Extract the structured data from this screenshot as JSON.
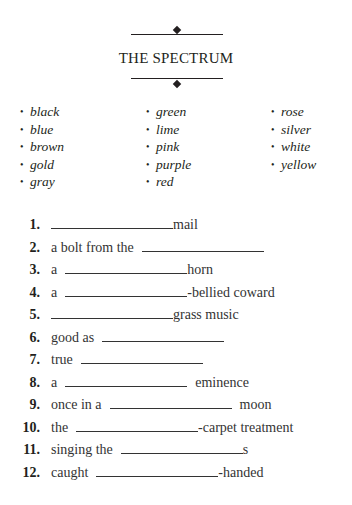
{
  "header": {
    "title": "THE SPECTRUM",
    "ornament_icon": "diamond-icon"
  },
  "word_bank": {
    "columns": [
      [
        "black",
        "blue",
        "brown",
        "gold",
        "gray"
      ],
      [
        "green",
        "lime",
        "pink",
        "purple",
        "red"
      ],
      [
        "rose",
        "silver",
        "white",
        "yellow"
      ]
    ],
    "bullet": "•"
  },
  "items": [
    {
      "num": "1.",
      "before": "",
      "after": "mail",
      "blank_width": 122,
      "gap_before": 0,
      "gap_after": 0
    },
    {
      "num": "2.",
      "before": "a bolt from the",
      "after": "",
      "blank_width": 122,
      "gap_before": 8,
      "gap_after": 0
    },
    {
      "num": "3.",
      "before": "a",
      "after": "horn",
      "blank_width": 122,
      "gap_before": 8,
      "gap_after": 0
    },
    {
      "num": "4.",
      "before": "a",
      "after": "-bellied coward",
      "blank_width": 122,
      "gap_before": 8,
      "gap_after": 0
    },
    {
      "num": "5.",
      "before": "",
      "after": "grass music",
      "blank_width": 122,
      "gap_before": 0,
      "gap_after": 0
    },
    {
      "num": "6.",
      "before": "good as",
      "after": "",
      "blank_width": 122,
      "gap_before": 8,
      "gap_after": 0
    },
    {
      "num": "7.",
      "before": "true",
      "after": "",
      "blank_width": 122,
      "gap_before": 8,
      "gap_after": 0
    },
    {
      "num": "8.",
      "before": "a",
      "after": "eminence",
      "blank_width": 122,
      "gap_before": 8,
      "gap_after": 8
    },
    {
      "num": "9.",
      "before": "once in a",
      "after": "moon",
      "blank_width": 122,
      "gap_before": 8,
      "gap_after": 8
    },
    {
      "num": "10.",
      "before": "the",
      "after": "-carpet treatment",
      "blank_width": 122,
      "gap_before": 8,
      "gap_after": 0
    },
    {
      "num": "11.",
      "before": "singing the",
      "after": "s",
      "blank_width": 122,
      "gap_before": 8,
      "gap_after": 0
    },
    {
      "num": "12.",
      "before": "caught",
      "after": "-handed",
      "blank_width": 122,
      "gap_before": 8,
      "gap_after": 0
    }
  ]
}
